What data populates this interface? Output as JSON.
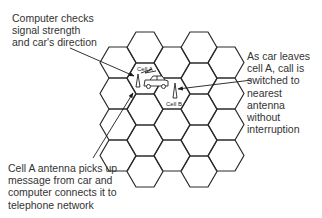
{
  "diagram": {
    "callouts": [
      {
        "id": "computer-checks",
        "text": "Computer checks\nsignal strength\nand car's direction"
      },
      {
        "id": "car-leaves",
        "text": "As car leaves\ncell A, call is\nswitched to\nnearest\nantenna\nwithout\ninterruption"
      },
      {
        "id": "cell-a-antenna",
        "text": "Cell A antenna picks up\nmessage from car and\ncomputer connects it to\ntelephone network"
      }
    ],
    "cells": {
      "a_label": "Cell A",
      "b_label": "Cell B"
    },
    "colors": {
      "line": "#2a2a2a",
      "background": "#ffffff"
    }
  }
}
